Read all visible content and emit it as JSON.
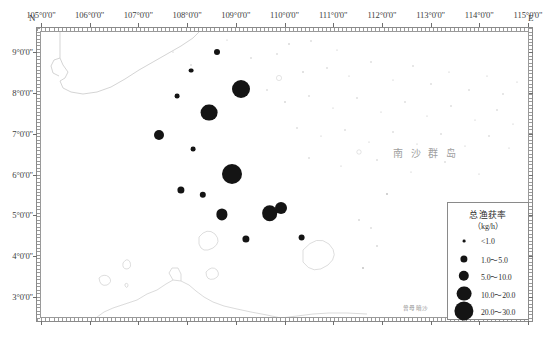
{
  "figure": {
    "kind": "thematic-point-map",
    "region": "南沙群岛 (Nansha Islands) sea area",
    "north_letter": "N",
    "east_letter": "E"
  },
  "axes": {
    "longitude_labels": [
      "105°0'0\"",
      "106°0'0\"",
      "107°0'0\"",
      "108°0'0\"",
      "109°0'0\"",
      "110°0'0\"",
      "111°0'0\"",
      "112°0'0\"",
      "113°0'0\"",
      "114°0'0\"",
      "115°0'0\""
    ],
    "latitude_labels": [
      "9°0'0\"",
      "8°0'0\"",
      "7°0'0\"",
      "6°0'0\"",
      "5°0'0\"",
      "4°0'0\"",
      "3°0'0\""
    ],
    "lon_min": 105,
    "lon_max": 115,
    "lat_min": 2.5,
    "lat_max": 9.5
  },
  "place_labels": [
    {
      "name": "nansha-islands",
      "text": "南沙群岛"
    },
    {
      "name": "zengmu-ansha",
      "text": "曾母暗沙"
    }
  ],
  "legend": {
    "title": "总渔获率",
    "unit": "（kg/h）",
    "entries": [
      {
        "label": "<1.0",
        "radius": 1.4
      },
      {
        "label": "1.0～5.0",
        "radius": 3.6
      },
      {
        "label": "5.0～10.0",
        "radius": 5.2
      },
      {
        "label": "10.0～20.0",
        "radius": 7.4
      },
      {
        "label": "20.0～30.0",
        "radius": 9.6
      }
    ]
  },
  "chart_data": {
    "type": "scatter",
    "xlabel": "Longitude (E)",
    "ylabel": "Latitude (N)",
    "xlim": [
      105,
      115
    ],
    "ylim": [
      2.5,
      9.5
    ],
    "grid": false,
    "legend_position": "bottom-right",
    "value_units": "kg/h",
    "size_classes": [
      "<1.0",
      "1.0～5.0",
      "5.0～10.0",
      "10.0～20.0",
      "20.0～30.0"
    ],
    "points": [
      {
        "lon": 108.62,
        "lat": 9.02,
        "class": "1.0～5.0",
        "r": 3.0
      },
      {
        "lon": 108.08,
        "lat": 8.55,
        "class": "1.0～5.0",
        "r": 2.4
      },
      {
        "lon": 109.1,
        "lat": 8.1,
        "class": "20.0～30.0",
        "r": 9.0
      },
      {
        "lon": 107.8,
        "lat": 7.92,
        "class": "1.0～5.0",
        "r": 2.4
      },
      {
        "lon": 108.45,
        "lat": 7.52,
        "class": "20.0～30.0",
        "r": 8.4
      },
      {
        "lon": 107.42,
        "lat": 6.98,
        "class": "10.0～20.0",
        "r": 5.0
      },
      {
        "lon": 108.12,
        "lat": 6.62,
        "class": "1.0～5.0",
        "r": 2.4
      },
      {
        "lon": 108.92,
        "lat": 6.02,
        "class": "20.0～30.0",
        "r": 10.0
      },
      {
        "lon": 107.88,
        "lat": 5.62,
        "class": "5.0～10.0",
        "r": 3.6
      },
      {
        "lon": 108.32,
        "lat": 5.5,
        "class": "5.0～10.0",
        "r": 3.2
      },
      {
        "lon": 108.72,
        "lat": 5.02,
        "class": "10.0～20.0",
        "r": 5.6
      },
      {
        "lon": 109.7,
        "lat": 5.05,
        "class": "20.0～30.0",
        "r": 7.8
      },
      {
        "lon": 109.92,
        "lat": 5.18,
        "class": "10.0～20.0",
        "r": 6.0
      },
      {
        "lon": 109.2,
        "lat": 4.42,
        "class": "5.0～10.0",
        "r": 3.6
      },
      {
        "lon": 110.35,
        "lat": 4.45,
        "class": "5.0～10.0",
        "r": 3.4
      }
    ],
    "reef_markers_note": "scattered sub-pixel reef symbols across the Nansha area (non-data cartographic symbols)"
  }
}
